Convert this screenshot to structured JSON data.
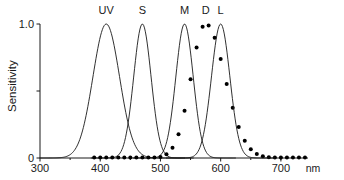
{
  "chart_data": {
    "type": "line",
    "title": "",
    "xlabel": "",
    "ylabel": "Sensitivity",
    "xunit": "nm",
    "xlim": [
      300,
      745
    ],
    "ylim": [
      0,
      1.0
    ],
    "grid": false,
    "legend_position": "above-peaks",
    "xticks": [
      300,
      400,
      500,
      600,
      700
    ],
    "xtick_labels": [
      "300",
      "400",
      "500",
      "600",
      "700"
    ],
    "yticks": [
      0,
      0.5,
      1.0
    ],
    "ytick_labels": [
      "0",
      "",
      "1.0"
    ],
    "series": [
      {
        "name": "UV",
        "label": "UV",
        "style": "solid",
        "peak_x": 410,
        "peak_y": 1.0,
        "width_nm": 52,
        "label_x": 410,
        "x": [
          300,
          310,
          320,
          330,
          340,
          350,
          360,
          370,
          380,
          390,
          400,
          410,
          420,
          430,
          440,
          450,
          460,
          470,
          480,
          490,
          500,
          510
        ],
        "values": [
          0.0,
          0.01,
          0.02,
          0.05,
          0.1,
          0.18,
          0.3,
          0.45,
          0.63,
          0.82,
          0.96,
          1.0,
          0.96,
          0.84,
          0.66,
          0.47,
          0.3,
          0.17,
          0.08,
          0.035,
          0.012,
          0.004
        ]
      },
      {
        "name": "S",
        "label": "S",
        "style": "solid",
        "peak_x": 470,
        "peak_y": 1.0,
        "width_nm": 34,
        "label_x": 470,
        "x": [
          410,
          420,
          430,
          440,
          450,
          460,
          470,
          480,
          490,
          500,
          510,
          520,
          530,
          540
        ],
        "values": [
          0.0,
          0.02,
          0.07,
          0.2,
          0.45,
          0.8,
          1.0,
          0.8,
          0.45,
          0.2,
          0.07,
          0.02,
          0.006,
          0.0
        ]
      },
      {
        "name": "M",
        "label": "M",
        "style": "solid",
        "peak_x": 540,
        "peak_y": 1.0,
        "width_nm": 34,
        "label_x": 540,
        "x": [
          480,
          490,
          500,
          510,
          520,
          530,
          540,
          550,
          560,
          570,
          580,
          590,
          600,
          610
        ],
        "values": [
          0.0,
          0.02,
          0.07,
          0.2,
          0.45,
          0.8,
          1.0,
          0.8,
          0.45,
          0.2,
          0.07,
          0.02,
          0.006,
          0.0
        ]
      },
      {
        "name": "D",
        "label": "D",
        "style": "dotted",
        "peak_x": 575,
        "peak_y": 1.0,
        "width_nm": 62,
        "label_x": 575,
        "x": [
          390,
          400,
          410,
          420,
          430,
          440,
          450,
          460,
          470,
          480,
          490,
          500,
          510,
          520,
          530,
          540,
          550,
          560,
          570,
          580,
          590,
          600,
          610,
          620,
          630,
          640,
          650,
          660,
          670,
          680,
          690,
          700,
          710,
          720,
          730,
          740
        ],
        "values": [
          0.01,
          0.01,
          0.015,
          0.02,
          0.04,
          0.06,
          0.09,
          0.13,
          0.18,
          0.24,
          0.32,
          0.42,
          0.53,
          0.65,
          0.78,
          0.89,
          0.96,
          0.99,
          1.0,
          0.97,
          0.9,
          0.79,
          0.66,
          0.53,
          0.4,
          0.29,
          0.2,
          0.13,
          0.08,
          0.05,
          0.03,
          0.02,
          0.012,
          0.008,
          0.005,
          0.004
        ]
      },
      {
        "name": "L",
        "label": "L",
        "style": "solid",
        "peak_x": 600,
        "peak_y": 1.0,
        "width_nm": 36,
        "label_x": 600,
        "x": [
          540,
          550,
          560,
          570,
          580,
          590,
          600,
          610,
          620,
          630,
          640,
          650,
          660,
          670
        ],
        "values": [
          0.0,
          0.02,
          0.07,
          0.2,
          0.45,
          0.8,
          1.0,
          0.8,
          0.45,
          0.2,
          0.07,
          0.02,
          0.006,
          0.0
        ]
      }
    ]
  }
}
